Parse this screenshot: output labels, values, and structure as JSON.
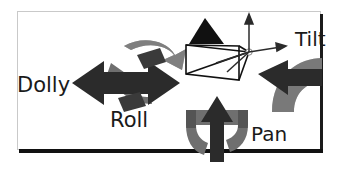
{
  "figure": {
    "background_color": "#ffffff",
    "frame_border_color": "#c9c9c9",
    "frame_accent_color": "#111111"
  },
  "labels": {
    "dolly": "Dolly",
    "roll": "Roll",
    "tilt": "Tilt",
    "pan": "Pan"
  },
  "colors": {
    "arrow_dark": "#2b2b2b",
    "arrow_gray": "#7a7a7a",
    "wireframe": "#111111",
    "text": "#1a1a1a"
  },
  "elements": {
    "camera_frustum": "camera-frustum-wireframe",
    "camera_marker": "black-triangle-marker",
    "axes": "coordinate-axes",
    "dolly_arrow": "horizontal-double-arrow",
    "roll_arrow": "circular-rotation-arrow",
    "tilt_arrow": "tilt-rotation-arrow",
    "pan_arrow_translate": "vertical-up-arrow",
    "pan_arrow_rotate": "pan-rotation-arrow"
  }
}
